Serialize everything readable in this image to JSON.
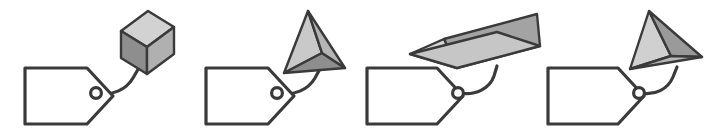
{
  "figure": {
    "width": 724,
    "height": 137,
    "background_color": "#ffffff",
    "outline_color": "#3a3a3a",
    "cord_color": "#3a3a3a",
    "tag_fill": "#ffffff"
  },
  "palette": {
    "face_light": "#d9d9d9",
    "face_mid": "#b4b4b4",
    "face_dark": "#8c8c8c",
    "face_darker": "#7a7a7a",
    "face_highlight": "#e8e8e8",
    "outline": "#3a3a3a"
  },
  "panels": [
    {
      "index": 1,
      "name": "panel-cube",
      "shape_label": "cube",
      "shape_type": "cube",
      "face_count": 3,
      "faces": [
        {
          "name": "top-face",
          "tone": "#d2d2d2"
        },
        {
          "name": "left-face",
          "tone": "#8e8e8e"
        },
        {
          "name": "right-face",
          "tone": "#b0b0b0"
        }
      ],
      "tag": {
        "name": "tag-1",
        "eyelet": true
      },
      "cord": {
        "name": "cord-1"
      }
    },
    {
      "index": 2,
      "name": "panel-tetrahedron-a",
      "shape_label": "tetrahedron",
      "shape_type": "tetrahedron",
      "face_count": 3,
      "faces": [
        {
          "name": "upper-left-face",
          "tone": "#c9c9c9"
        },
        {
          "name": "lower-face",
          "tone": "#8e8e8e"
        },
        {
          "name": "right-face",
          "tone": "#b5b5b5"
        }
      ],
      "tag": {
        "name": "tag-2",
        "eyelet": true
      },
      "cord": {
        "name": "cord-2"
      }
    },
    {
      "index": 3,
      "name": "panel-triangular-prism",
      "shape_label": "triangular prism",
      "shape_type": "prism",
      "face_count": 3,
      "faces": [
        {
          "name": "end-triangle-face",
          "tone": "#d6d6d6"
        },
        {
          "name": "front-slope-face",
          "tone": "#c6c6c6"
        },
        {
          "name": "top-slope-face",
          "tone": "#a3a3a3"
        }
      ],
      "tag": {
        "name": "tag-3",
        "eyelet": true
      },
      "cord": {
        "name": "cord-3"
      }
    },
    {
      "index": 4,
      "name": "panel-tetrahedron-b",
      "shape_label": "tetrahedron",
      "shape_type": "tetrahedron",
      "face_count": 3,
      "faces": [
        {
          "name": "left-face",
          "tone": "#d0d0d0"
        },
        {
          "name": "right-face",
          "tone": "#9a9a9a"
        },
        {
          "name": "bottom-face",
          "tone": "#b9b9b9"
        }
      ],
      "tag": {
        "name": "tag-4",
        "eyelet": true
      },
      "cord": {
        "name": "cord-4"
      }
    }
  ]
}
